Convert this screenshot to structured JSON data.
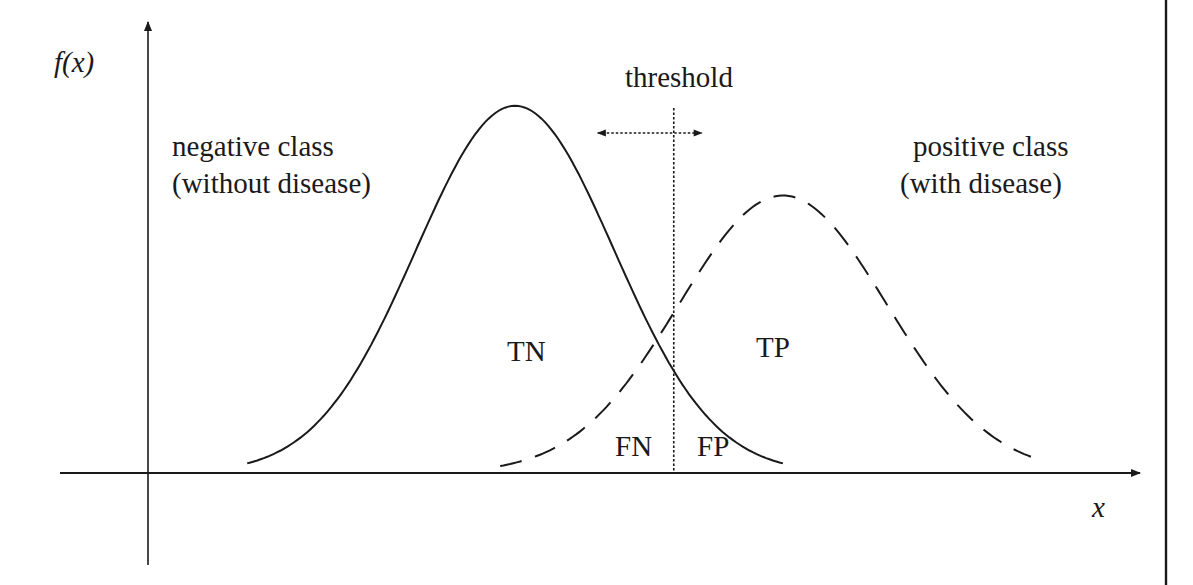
{
  "diagram": {
    "type": "overlapping-distributions",
    "y_axis_label": "f(x)",
    "x_axis_label": "x",
    "threshold_label": "threshold",
    "threshold_arrow": "bidirectional-horizontal",
    "negative_class": {
      "label_line1": "negative class",
      "label_line2": "(without disease)",
      "line_style": "solid"
    },
    "positive_class": {
      "label_line1": "positive class",
      "label_line2": "(with disease)",
      "line_style": "dashed"
    },
    "regions": {
      "tn": "TN",
      "tp": "TP",
      "fn": "FN",
      "fp": "FP"
    },
    "colors": {
      "ink": "#1a1a1a",
      "background": "#ffffff"
    }
  },
  "chart_data": {
    "type": "line",
    "title": "",
    "xlabel": "x",
    "ylabel": "f(x)",
    "grid": false,
    "legend": "none",
    "xlim": [
      0,
      10
    ],
    "ylim": [
      0,
      1.0
    ],
    "threshold_x": 5.3,
    "series": [
      {
        "name": "negative class (without disease)",
        "style": "solid",
        "distribution": "bell",
        "mean": 3.7,
        "sd": 1.0,
        "peak": 0.9,
        "x_range": [
          1.0,
          6.4
        ]
      },
      {
        "name": "positive class (with disease)",
        "style": "dashed",
        "distribution": "bell",
        "mean": 6.4,
        "sd": 1.05,
        "peak": 0.68,
        "x_range": [
          3.55,
          8.9
        ]
      }
    ],
    "annotations": [
      "threshold",
      "TN",
      "TP",
      "FN",
      "FP",
      "negative class (without disease)",
      "positive class (with disease)"
    ]
  }
}
